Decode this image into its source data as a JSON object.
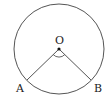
{
  "diagram": {
    "type": "circle-sector",
    "colors": {
      "stroke": "#555555",
      "text": "#222222",
      "background": "#ffffff"
    },
    "circle": {
      "cx": 59,
      "cy": 49,
      "r": 45
    },
    "center": {
      "label": "O",
      "x": 59,
      "y": 49
    },
    "points": [
      {
        "label": "A",
        "x": 27,
        "y": 80
      },
      {
        "label": "B",
        "x": 91,
        "y": 80
      }
    ],
    "angle_marker": "arc at O between OA and OB"
  }
}
